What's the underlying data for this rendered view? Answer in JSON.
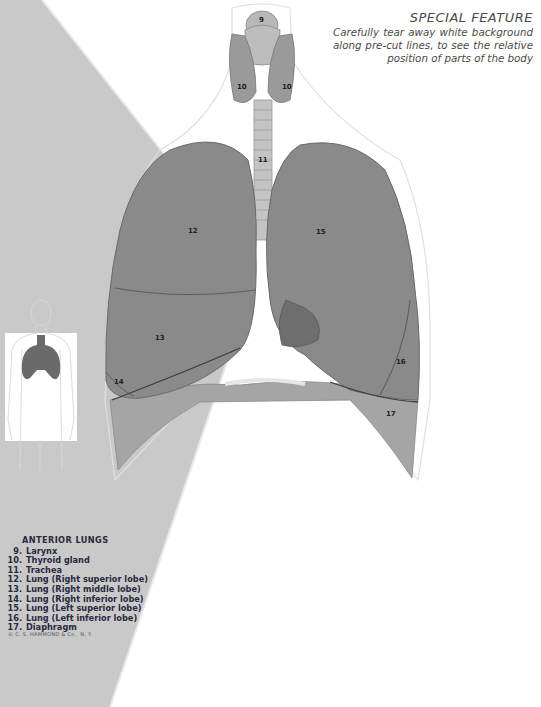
{
  "special_feature": {
    "title": "SPECIAL FEATURE",
    "body": "Carefully tear away white background along pre-cut lines, to see the relative position of parts of the body"
  },
  "legend": {
    "title": "ANTERIOR LUNGS",
    "items": [
      {
        "num": "9.",
        "label": "Larynx"
      },
      {
        "num": "10.",
        "label": "Thyroid gland"
      },
      {
        "num": "11.",
        "label": "Trachea"
      },
      {
        "num": "12.",
        "label": "Lung (Right superior lobe)"
      },
      {
        "num": "13.",
        "label": "Lung (Right middle lobe)"
      },
      {
        "num": "14.",
        "label": "Lung (Right inferior lobe)"
      },
      {
        "num": "15.",
        "label": "Lung (Left superior lobe)"
      },
      {
        "num": "16.",
        "label": "Lung (Left inferior lobe)"
      },
      {
        "num": "17.",
        "label": "Diaphragm"
      }
    ]
  },
  "copyright": "© C. S. HAMMOND & Co., N. Y.",
  "labels": {
    "larynx": "9",
    "thyroid_left": "10",
    "thyroid_right": "10",
    "trachea": "11",
    "right_superior": "12",
    "right_middle": "13",
    "right_inferior": "14",
    "left_superior": "15",
    "left_inferior": "16",
    "diaphragm": "17"
  },
  "colors": {
    "background_grey": "#c9c9c9",
    "paper_white": "#ffffff",
    "lung": "#8a8a8a",
    "lung_dark": "#6e6e6e",
    "diaphragm": "#a5a5a5",
    "text": "#2a2a40"
  }
}
